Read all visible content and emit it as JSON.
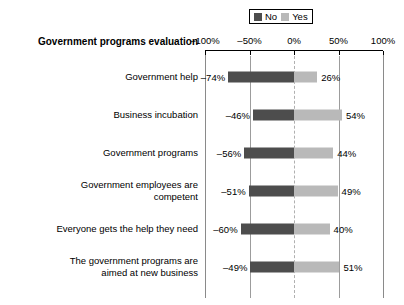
{
  "chart_data": {
    "type": "bar",
    "subtype": "diverging-stacked-bar",
    "title": "Government programs evaluation",
    "xlabel": "",
    "ylabel": "",
    "xlim": [
      -100,
      100
    ],
    "grid": true,
    "gridlines_at": [
      -50,
      50
    ],
    "zero_line": true,
    "legend_position": "top-right",
    "legend": [
      {
        "name": "No",
        "color": "#4d4d4d"
      },
      {
        "name": "Yes",
        "color": "#b9b9b9"
      }
    ],
    "tick_labels": [
      "-100%",
      "-50%",
      "0%",
      "50%",
      "100%"
    ],
    "tick_values": [
      -100,
      -50,
      0,
      50,
      100
    ],
    "categories": [
      "Government help",
      "Business incubation",
      "Government programs",
      "Government employees are\ncompetent",
      "Everyone gets the help they need",
      "The government programs are\naimed at new business"
    ],
    "series": [
      {
        "name": "No",
        "values": [
          -74,
          -46,
          -56,
          -51,
          -60,
          -49
        ],
        "labels": [
          "-74%",
          "-46%",
          "-56%",
          "-51%",
          "-60%",
          "-49%"
        ]
      },
      {
        "name": "Yes",
        "values": [
          26,
          54,
          44,
          49,
          40,
          51
        ],
        "labels": [
          "26%",
          "54%",
          "44%",
          "49%",
          "40%",
          "51%"
        ]
      }
    ],
    "rows": [
      {
        "category": "Government help",
        "no": -74,
        "yes": 26,
        "no_label": "-74%",
        "yes_label": "26%"
      },
      {
        "category": "Business incubation",
        "no": -46,
        "yes": 54,
        "no_label": "-46%",
        "yes_label": "54%"
      },
      {
        "category": "Government programs",
        "no": -56,
        "yes": 44,
        "no_label": "-56%",
        "yes_label": "44%"
      },
      {
        "category": "Government employees are\ncompetent",
        "no": -51,
        "yes": 49,
        "no_label": "-51%",
        "yes_label": "49%"
      },
      {
        "category": "Everyone gets the help they need",
        "no": -60,
        "yes": 40,
        "no_label": "-60%",
        "yes_label": "40%"
      },
      {
        "category": "The government programs are\naimed at new business",
        "no": -49,
        "yes": 51,
        "no_label": "-49%",
        "yes_label": "51%"
      }
    ]
  },
  "colors": {
    "no": "#4d4d4d",
    "yes": "#b9b9b9",
    "axis": "#000000",
    "grid": "#9c9c9c",
    "zero": "#b0b0b0",
    "background": "#ffffff",
    "text": "#000000"
  }
}
